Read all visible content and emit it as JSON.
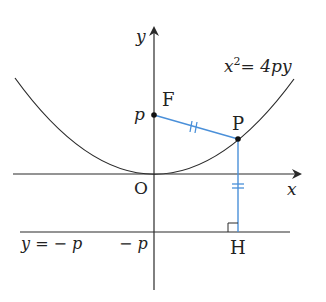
{
  "diagram": {
    "colors": {
      "ink": "#2a2a2a",
      "accent": "#4a90d9",
      "background": "#ffffff"
    },
    "axes": {
      "x_label": "x",
      "y_label": "y",
      "origin_label": "O"
    },
    "curve": {
      "equation_lhs": "x",
      "equation_exp": "2",
      "equation_rhs": "= 4py"
    },
    "points": {
      "focus_label": "F",
      "point_label": "P",
      "foot_label": "H"
    },
    "tick_labels": {
      "p": "p",
      "neg_p": "− p"
    },
    "directrix": {
      "label": "y = − p"
    }
  }
}
